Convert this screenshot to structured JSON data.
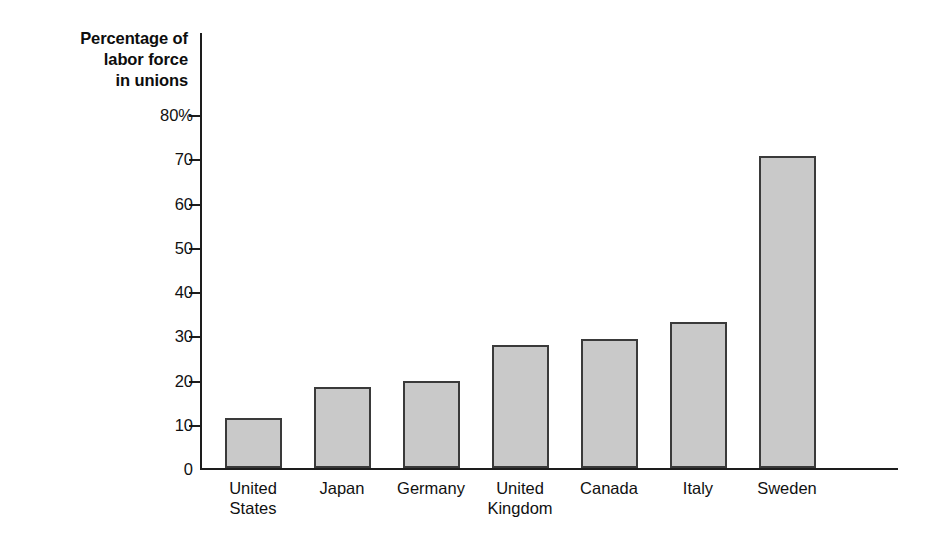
{
  "chart_data": {
    "type": "bar",
    "title": "Percentage of labor force in unions",
    "title_lines": [
      "Percentage of",
      "labor force",
      "in unions"
    ],
    "xlabel": "",
    "ylabel": "Percentage of labor force in unions",
    "ylim": [
      0,
      80
    ],
    "grid": false,
    "legend": null,
    "y_ticks": [
      {
        "value": 80,
        "label": "80%"
      },
      {
        "value": 70,
        "label": "70"
      },
      {
        "value": 60,
        "label": "60"
      },
      {
        "value": 50,
        "label": "50"
      },
      {
        "value": 40,
        "label": "40"
      },
      {
        "value": 30,
        "label": "30"
      },
      {
        "value": 20,
        "label": "20"
      },
      {
        "value": 10,
        "label": "10"
      },
      {
        "value": 0,
        "label": "0"
      }
    ],
    "categories": [
      "United States",
      "Japan",
      "Germany",
      "United Kingdom",
      "Canada",
      "Italy",
      "Sweden"
    ],
    "category_label_lines": [
      [
        "United",
        "States"
      ],
      [
        "Japan"
      ],
      [
        "Germany"
      ],
      [
        "United",
        "Kingdom"
      ],
      [
        "Canada"
      ],
      [
        "Italy"
      ],
      [
        "Sweden"
      ]
    ],
    "values": [
      11.3,
      18.3,
      19.7,
      27.8,
      29.2,
      33.0,
      70.5
    ],
    "bar_fill_color": "#c9c9c9",
    "bar_border_color": "#3a3a3a",
    "axis_color": "#1d1d1d",
    "background_color": "#ffffff"
  }
}
